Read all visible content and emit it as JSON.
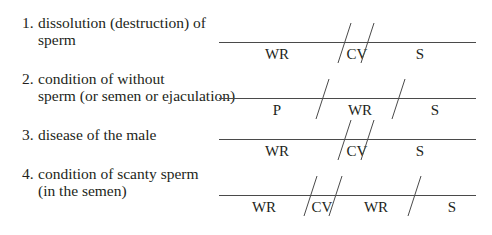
{
  "exercise": {
    "items": [
      {
        "number": "1.",
        "line1": "dissolution (destruction) of",
        "line2": "sperm",
        "segments": [
          "WR",
          "CV",
          "S"
        ]
      },
      {
        "number": "2.",
        "line1": "condition of without",
        "line2": "sperm (or semen or ejaculation)",
        "segments": [
          "P",
          "WR",
          "S"
        ]
      },
      {
        "number": "3.",
        "line1": "disease of the male",
        "line2": "",
        "segments": [
          "WR",
          "CV",
          "S"
        ]
      },
      {
        "number": "4.",
        "line1": "condition of scanty sperm",
        "line2": "(in the semen)",
        "segments": [
          "WR",
          "CV",
          "WR",
          "S"
        ]
      }
    ]
  },
  "colors": {
    "text": "#231f20",
    "line": "#4a4a4a",
    "background": "#ffffff"
  }
}
